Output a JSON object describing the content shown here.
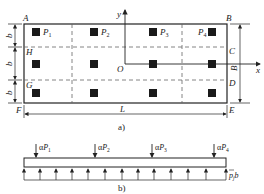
{
  "figure_a": {
    "caption": "a)",
    "corner_labels": {
      "A": "A",
      "B": "B",
      "E": "E",
      "F": "F"
    },
    "side_labels": {
      "H": "H",
      "G": "G",
      "C": "C",
      "D": "D"
    },
    "origin_label": "O",
    "x_axis_label": "x",
    "y_axis_label": "y",
    "loads": [
      {
        "name": "P",
        "sub": "1"
      },
      {
        "name": "P",
        "sub": "2"
      },
      {
        "name": "P",
        "sub": "3"
      },
      {
        "name": "P",
        "sub": "4"
      }
    ],
    "strip_width_label": "b",
    "width_label": "B",
    "length_label": "L"
  },
  "figure_b": {
    "caption": "b)",
    "load_prefix": "α",
    "loads": [
      {
        "name": "P",
        "sub": "1"
      },
      {
        "name": "P",
        "sub": "2"
      },
      {
        "name": "P",
        "sub": "3"
      },
      {
        "name": "P",
        "sub": "4"
      }
    ],
    "pressure_label": "p",
    "pressure_sub": "j",
    "pressure_suffix": "b"
  },
  "colors": {
    "line": "#222222",
    "column": "#1a1a1a",
    "dash": "#666666"
  }
}
